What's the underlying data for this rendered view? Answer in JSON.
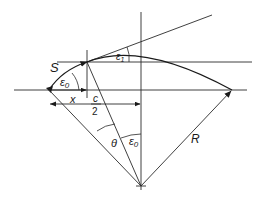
{
  "diagram": {
    "type": "geometric construction — circular arc of radius R",
    "colors": {
      "stroke": "#2a2a2a",
      "background": "#ffffff"
    },
    "labels": {
      "S": "S",
      "epsilon0_top": "ε",
      "epsilon0_top_sub": "0",
      "epsilon1": "ε",
      "epsilon1_sub": "1",
      "x": "x",
      "c_num": "c",
      "c_den": "2",
      "theta": "θ",
      "epsilon0_bottom": "ε",
      "epsilon0_bottom_sub": "0",
      "R": "R"
    },
    "elements": [
      "vertical axis through circle centre",
      "upper horizontal line through arc start point",
      "lower horizontal line (chord level)",
      "short vertical line at arc start point",
      "circular arc from left chord end to right chord end",
      "arc S with arrow from left end to start point",
      "tangent line at start point",
      "radius R to right chord end",
      "radius to left chord end",
      "radius to start point",
      "dimension arrow x",
      "dimension arrow c/2",
      "angle arcs ε0, ε1, θ, ε0"
    ]
  }
}
